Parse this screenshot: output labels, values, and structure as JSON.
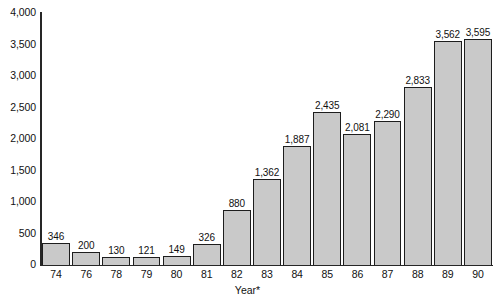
{
  "chart_data": {
    "type": "bar",
    "title": "",
    "subtitle": "",
    "xlabel": "Year*",
    "ylabel": "",
    "categories": [
      "74",
      "76",
      "78",
      "79",
      "80",
      "81",
      "82",
      "83",
      "84",
      "85",
      "86",
      "87",
      "88",
      "89",
      "90"
    ],
    "values": [
      346,
      200,
      130,
      121,
      149,
      326,
      880,
      1362,
      1887,
      2435,
      2081,
      2290,
      2833,
      3562,
      3595
    ],
    "value_labels": [
      "346",
      "200",
      "130",
      "121",
      "149",
      "326",
      "880",
      "1,362",
      "1,887",
      "2,435",
      "2,081",
      "2,290",
      "2,833",
      "3,562",
      "3,595"
    ],
    "ylim": [
      0,
      4000
    ],
    "ytick_values": [
      0,
      500,
      1000,
      1500,
      2000,
      2500,
      3000,
      3500,
      4000
    ],
    "ytick_labels": [
      "0",
      "500",
      "1,000",
      "1,500",
      "2,000",
      "2,500",
      "3,000",
      "3,500",
      "4,000"
    ],
    "grid": false,
    "legend": null,
    "bar_fill_color": "#c9c9c9",
    "bar_border_color": "#1d1d1d",
    "axis_color": "#262626",
    "background_color": "#ffffff",
    "data_labels_shown": true
  }
}
